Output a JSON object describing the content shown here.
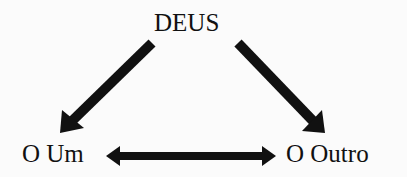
{
  "diagram": {
    "type": "triangle-relationship",
    "nodes": {
      "top": {
        "label": "DEUS"
      },
      "left": {
        "label": "O Um"
      },
      "right": {
        "label": "O Outro"
      }
    },
    "edges": [
      {
        "from": "DEUS",
        "to": "O Um",
        "direction": "one-way"
      },
      {
        "from": "DEUS",
        "to": "O Outro",
        "direction": "one-way"
      },
      {
        "from": "O Um",
        "to": "O Outro",
        "direction": "two-way"
      }
    ],
    "colors": {
      "background": "#fbfbfb",
      "ink": "#111111"
    }
  }
}
